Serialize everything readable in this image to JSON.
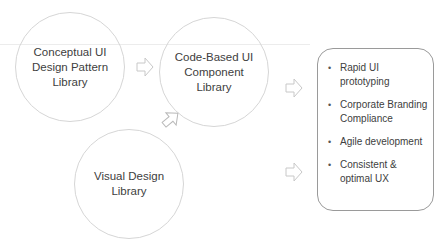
{
  "diagram": {
    "nodes": [
      {
        "id": "conceptual",
        "label": "Conceptual  UI\nDesign Pattern\nLibrary"
      },
      {
        "id": "code_based",
        "label": "Code-Based UI\nComponent\nLibrary"
      },
      {
        "id": "visual",
        "label": "Visual Design\nLibrary"
      }
    ],
    "benefits": {
      "items": [
        "Rapid UI\nprototyping",
        "Corporate Branding\nCompliance",
        "Agile development",
        "Consistent &\noptimal UX"
      ],
      "bullet": "•"
    },
    "arrows": [
      {
        "from": "conceptual",
        "to": "code_based",
        "direction": "right",
        "icon": "block-arrow-right-icon"
      },
      {
        "from": "visual",
        "to": "code_based",
        "direction": "up-right",
        "icon": "block-arrow-diagonal-icon"
      },
      {
        "from": "code_based",
        "to": "benefits",
        "direction": "right",
        "icon": "block-arrow-right-icon"
      },
      {
        "from": "visual",
        "to": "benefits",
        "direction": "right",
        "icon": "block-arrow-right-icon"
      }
    ],
    "colors": {
      "circle_stroke": "#d6d6d6",
      "box_stroke": "#9a9a9a",
      "arrow_stroke": "#c8c8c8",
      "text": "#404040",
      "background": "#ffffff"
    }
  }
}
